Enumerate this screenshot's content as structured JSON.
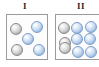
{
  "figure": {
    "title": "",
    "background_color": "#ffffff",
    "width": 99,
    "height": 67
  },
  "colors": {
    "box_border": "#9a9a9a",
    "box_fill": "#fdfdfd",
    "gray_sphere": "#cfcfcf",
    "blue_sphere": "#a8c6e8",
    "label_text": "#2b2b2b"
  },
  "panels": [
    {
      "label": "I",
      "label_x": 25,
      "label_y": 2,
      "box": {
        "x": 6,
        "y": 14,
        "width": 42,
        "height": 46
      },
      "sphere_counts": {
        "gray": 2,
        "blue": 3,
        "total": 5
      },
      "spheres": [
        {
          "type": "gray",
          "cx": 15,
          "cy": 28,
          "r": 6
        },
        {
          "type": "blue",
          "cx": 36,
          "cy": 26,
          "r": 6
        },
        {
          "type": "blue",
          "cx": 27,
          "cy": 38,
          "r": 6
        },
        {
          "type": "gray",
          "cx": 16,
          "cy": 49,
          "r": 6
        },
        {
          "type": "blue",
          "cx": 38,
          "cy": 49,
          "r": 6
        }
      ]
    },
    {
      "label": "II",
      "label_x": 81,
      "label_y": 2,
      "box": {
        "x": 55,
        "y": 14,
        "width": 46,
        "height": 46
      },
      "sphere_counts": {
        "gray": 3,
        "blue": 6,
        "total": 9
      },
      "spheres": [
        {
          "type": "gray",
          "cx": 63,
          "cy": 27,
          "r": 6
        },
        {
          "type": "blue",
          "cx": 76,
          "cy": 27,
          "r": 6
        },
        {
          "type": "blue",
          "cx": 90,
          "cy": 26,
          "r": 6
        },
        {
          "type": "blue",
          "cx": 76,
          "cy": 38,
          "r": 6
        },
        {
          "type": "blue",
          "cx": 89,
          "cy": 38,
          "r": 6
        },
        {
          "type": "gray",
          "cx": 64,
          "cy": 42,
          "r": 6
        },
        {
          "type": "gray",
          "cx": 64,
          "cy": 47,
          "r": 6
        },
        {
          "type": "blue",
          "cx": 77,
          "cy": 51,
          "r": 6
        },
        {
          "type": "blue",
          "cx": 90,
          "cy": 51,
          "r": 6
        }
      ]
    }
  ]
}
